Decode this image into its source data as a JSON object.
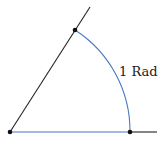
{
  "diagram": {
    "label": "1 Rad",
    "colors": {
      "black_line": "#222222",
      "blue": "#4a78c0",
      "point": "#111111"
    },
    "points": {
      "origin": [
        10,
        132
      ],
      "arc_start": [
        130,
        132
      ],
      "arc_end": [
        75,
        30
      ]
    },
    "radius": 120,
    "angle_rad": 1
  }
}
